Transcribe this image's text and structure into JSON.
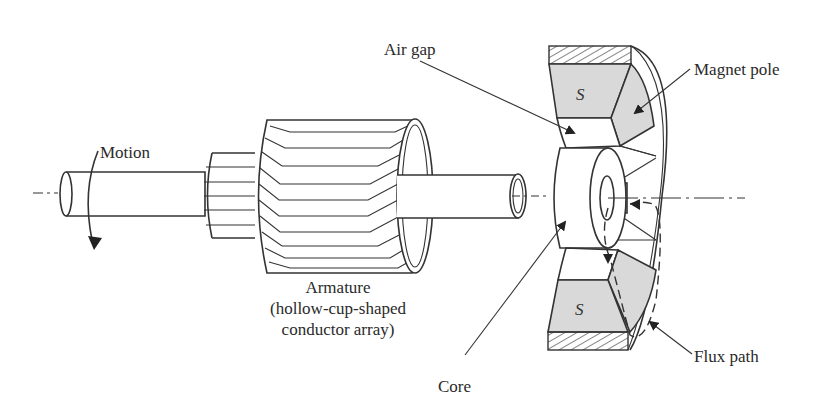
{
  "diagram": {
    "labels": {
      "motion": "Motion",
      "armature_line1": "Armature",
      "armature_line2": "(hollow-cup-shaped",
      "armature_line3": "conductor array)",
      "air_gap": "Air gap",
      "magnet_pole": "Magnet pole",
      "core": "Core",
      "flux_path": "Flux path",
      "pole_top": "S",
      "pole_bottom": "S"
    },
    "colors": {
      "line": "#333333",
      "pole_fill": "#d9d9d9",
      "background": "#ffffff"
    }
  }
}
